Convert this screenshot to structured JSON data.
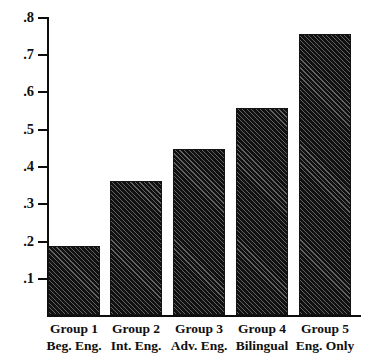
{
  "chart_data": {
    "type": "bar",
    "title": "",
    "subtitle": "",
    "xlabel": "",
    "ylabel": "",
    "categories": [
      "Group 1 Beg. Eng.",
      "Group 2 Int. Eng.",
      "Group 3 Adv. Eng.",
      "Group 4 Bilingual",
      "Group 5 Eng. Only"
    ],
    "values": [
      0.185,
      0.36,
      0.445,
      0.555,
      0.755
    ],
    "ylim": [
      0,
      0.8
    ],
    "ytick_labels": [
      ".8",
      ".7",
      ".6",
      ".5",
      ".4",
      ".3",
      ".2",
      ".1"
    ],
    "ytick_values": [
      0.8,
      0.7,
      0.6,
      0.5,
      0.4,
      0.3,
      0.2,
      0.1
    ],
    "grid": false,
    "legend": null,
    "bar_color": "#111111",
    "bar_pattern": "diagonal-hatch",
    "axis_color": "#0d0d0d"
  },
  "axis": {
    "ticks": [
      {
        "label": ".8",
        "value": 0.8
      },
      {
        "label": ".7",
        "value": 0.7
      },
      {
        "label": ".6",
        "value": 0.6
      },
      {
        "label": ".5",
        "value": 0.5
      },
      {
        "label": ".4",
        "value": 0.4
      },
      {
        "label": ".3",
        "value": 0.3
      },
      {
        "label": ".2",
        "value": 0.2
      },
      {
        "label": ".1",
        "value": 0.1
      }
    ]
  },
  "groups": [
    {
      "name": "Group 1",
      "detail": "Beg. Eng.",
      "value": 0.185
    },
    {
      "name": "Group 2",
      "detail": "Int. Eng.",
      "value": 0.36
    },
    {
      "name": "Group 3",
      "detail": "Adv. Eng.",
      "value": 0.445
    },
    {
      "name": "Group 4",
      "detail": "Bilingual",
      "value": 0.555
    },
    {
      "name": "Group 5",
      "detail": "Eng. Only",
      "value": 0.755
    }
  ]
}
